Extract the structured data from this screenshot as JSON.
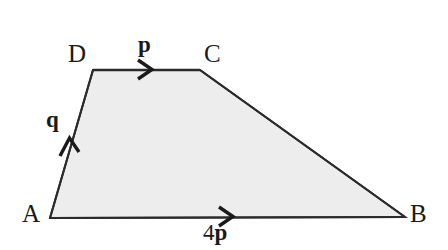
{
  "figure": {
    "kind": "vector-geometry-diagram",
    "canvas": {
      "width": 448,
      "height": 250
    },
    "background_color": "#ffffff",
    "shape": {
      "name": "trapezium-ABCD",
      "fill_color": "#ededed",
      "stroke_color": "#2b2b2b",
      "stroke_width": 2,
      "vertices": [
        {
          "name": "A",
          "x": 50,
          "y": 218
        },
        {
          "name": "B",
          "x": 405,
          "y": 217
        },
        {
          "name": "C",
          "x": 200,
          "y": 70
        },
        {
          "name": "D",
          "x": 93,
          "y": 70
        }
      ],
      "edges": [
        {
          "name": "AB",
          "from": "A",
          "to": "B"
        },
        {
          "name": "BC",
          "from": "B",
          "to": "C"
        },
        {
          "name": "CD",
          "from": "C",
          "to": "D"
        },
        {
          "name": "DA",
          "from": "D",
          "to": "A"
        }
      ]
    },
    "vertex_labels": [
      {
        "id": "A",
        "text": "A",
        "x": 22,
        "y": 201
      },
      {
        "id": "B",
        "text": "B",
        "x": 410,
        "y": 201
      },
      {
        "id": "C",
        "text": "C",
        "x": 204,
        "y": 41
      },
      {
        "id": "D",
        "text": "D",
        "x": 68,
        "y": 41
      }
    ],
    "vector_labels": [
      {
        "id": "p",
        "coefficient": "",
        "symbol": "p",
        "text": "p",
        "edge": "DC",
        "x": 138,
        "y": 33
      },
      {
        "id": "q",
        "coefficient": "",
        "symbol": "q",
        "text": "q",
        "edge": "AD",
        "x": 46,
        "y": 108
      },
      {
        "id": "4p",
        "coefficient": "4",
        "symbol": "p",
        "text": "4p",
        "edge": "AB",
        "x": 203,
        "y": 221
      }
    ],
    "arrow_markers": [
      {
        "id": "arrow-p",
        "edge": "DC",
        "direction": "right",
        "tip_x": 152,
        "tip_y": 69
      },
      {
        "id": "arrow-q",
        "edge": "AD",
        "direction": "up",
        "tip_x": 69,
        "tip_y": 138
      },
      {
        "id": "arrow-4p",
        "edge": "AB",
        "direction": "right",
        "tip_x": 233,
        "tip_y": 216
      }
    ]
  }
}
